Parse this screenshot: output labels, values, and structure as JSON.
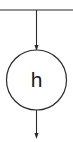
{
  "diagram": {
    "type": "flow",
    "colors": {
      "stroke": "#2a2a2a",
      "background": "#ffffff",
      "text": "#1a1a1a"
    },
    "top_bus": {
      "label": ""
    },
    "node": {
      "label": "h",
      "shape": "circle"
    },
    "edges": [
      {
        "from": "top-bus",
        "to": "h",
        "arrow": "down"
      },
      {
        "from": "h",
        "to": "output",
        "arrow": "down"
      }
    ]
  }
}
